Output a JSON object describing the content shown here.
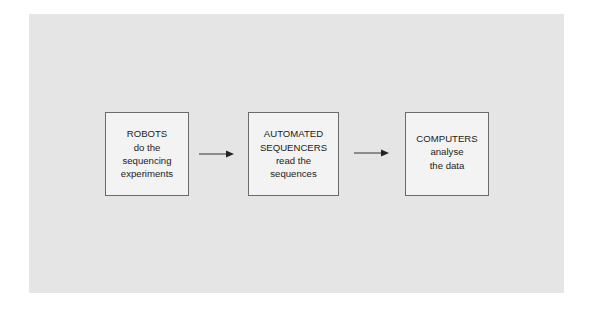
{
  "diagram": {
    "type": "flowchart",
    "direction": "left-to-right",
    "colors": {
      "panel_background": "#e5e5e5",
      "box_fill": "#f3f3f3",
      "box_border": "#6b6b6b",
      "text": "#222222",
      "arrow": "#222222"
    },
    "steps": [
      {
        "id": "robots",
        "lines": [
          "ROBOTS",
          "do the",
          "sequencing",
          "experiments"
        ]
      },
      {
        "id": "automated-sequencers",
        "lines": [
          "AUTOMATED",
          "SEQUENCERS",
          "read the",
          "sequences"
        ]
      },
      {
        "id": "computers",
        "lines": [
          "COMPUTERS",
          "analyse",
          "the data"
        ]
      }
    ],
    "connections": [
      {
        "from": "robots",
        "to": "automated-sequencers"
      },
      {
        "from": "automated-sequencers",
        "to": "computers"
      }
    ]
  }
}
